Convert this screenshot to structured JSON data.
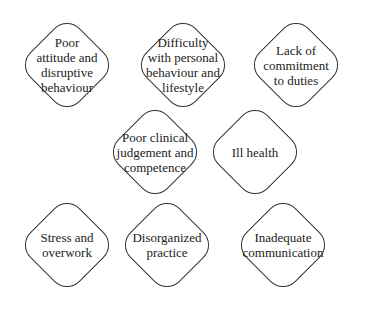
{
  "diagram": {
    "nodes": [
      {
        "id": "n1",
        "label": "Poor\nattitude and\ndisruptive\nbehaviour",
        "cx": 67,
        "cy": 65
      },
      {
        "id": "n2",
        "label": "Difficulty\nwith personal\nbehaviour and\nlifestyle",
        "cx": 183,
        "cy": 65
      },
      {
        "id": "n3",
        "label": "Lack of\ncommitment\nto duties",
        "cx": 296,
        "cy": 65
      },
      {
        "id": "n4",
        "label": "Poor clinical\njudgement and\ncompetence",
        "cx": 155,
        "cy": 152
      },
      {
        "id": "n5",
        "label": "Ill health",
        "cx": 255,
        "cy": 152
      },
      {
        "id": "n6",
        "label": "Stress and\noverwork",
        "cx": 67,
        "cy": 245
      },
      {
        "id": "n7",
        "label": "Disorganized\npractice",
        "cx": 167,
        "cy": 245
      },
      {
        "id": "n8",
        "label": "Inadequate\ncommunication",
        "cx": 283,
        "cy": 245
      }
    ],
    "colors": {
      "stroke": "#333333",
      "text": "#222222",
      "background": "#ffffff"
    }
  }
}
